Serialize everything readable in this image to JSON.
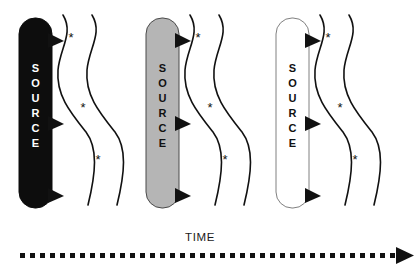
{
  "figure": {
    "type": "diagram",
    "title": "",
    "background_color": "#ffffff",
    "width": 416,
    "height": 266,
    "groups": [
      {
        "id": "group-1",
        "source_label": "SOURCE",
        "source_letters": [
          "S",
          "O",
          "U",
          "R",
          "C",
          "E"
        ],
        "fill_color": "#0d0d0d",
        "text_color": "#ffffff",
        "stroke_color": "#0d0d0d",
        "box": {
          "x": 19,
          "y": 18,
          "width": 33,
          "height": 190,
          "radius": 16
        },
        "arrow_count": 3,
        "arrow_y": [
          40,
          123,
          195
        ],
        "wave_count": 2,
        "asterisk_count": 3,
        "asterisks": [
          {
            "x": 71,
            "y": 42
          },
          {
            "x": 83,
            "y": 112
          },
          {
            "x": 98,
            "y": 164
          }
        ]
      },
      {
        "id": "group-2",
        "source_label": "SOURCE",
        "source_letters": [
          "S",
          "O",
          "U",
          "R",
          "C",
          "E"
        ],
        "fill_color": "#b5b5b5",
        "text_color": "#111111",
        "stroke_color": "#4a4a4a",
        "box": {
          "x": 146,
          "y": 18,
          "width": 33,
          "height": 190,
          "radius": 16
        },
        "arrow_count": 3,
        "arrow_y": [
          40,
          123,
          195
        ],
        "wave_count": 2,
        "asterisk_count": 3,
        "asterisks": [
          {
            "x": 198,
            "y": 42
          },
          {
            "x": 210,
            "y": 112
          },
          {
            "x": 225,
            "y": 164
          }
        ]
      },
      {
        "id": "group-3",
        "source_label": "SOURCE",
        "source_letters": [
          "S",
          "O",
          "U",
          "R",
          "C",
          "E"
        ],
        "fill_color": "#ffffff",
        "text_color": "#111111",
        "stroke_color": "#808080",
        "box": {
          "x": 276,
          "y": 18,
          "width": 33,
          "height": 190,
          "radius": 16
        },
        "arrow_count": 3,
        "arrow_y": [
          40,
          123,
          195
        ],
        "wave_count": 2,
        "asterisk_count": 3,
        "asterisks": [
          {
            "x": 328,
            "y": 42
          },
          {
            "x": 340,
            "y": 112
          },
          {
            "x": 355,
            "y": 164
          }
        ]
      }
    ],
    "axis": {
      "label": "TIME",
      "label_x": 200,
      "label_y": 241,
      "line_y": 256,
      "line_start_x": 20,
      "line_end_x": 396,
      "style": "dashed",
      "dash_length": 5,
      "dash_gap": 5,
      "color": "#111111",
      "arrow_tip_x": 414,
      "direction": "right"
    },
    "legend_note": "",
    "asterisk_glyph": "*"
  }
}
